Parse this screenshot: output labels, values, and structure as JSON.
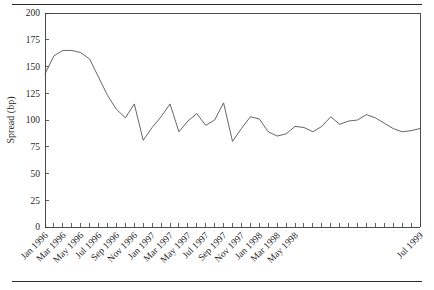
{
  "chart_data": {
    "type": "line",
    "title": "",
    "xlabel": "",
    "ylabel": "Spread (bp)",
    "ylim": [
      0,
      200
    ],
    "yticks": [
      0,
      25,
      50,
      75,
      100,
      125,
      150,
      175,
      200
    ],
    "grid": false,
    "legend": null,
    "xtick_labels": [
      "Jan 1996",
      "Mar 1996",
      "May 1996",
      "Jul 1996",
      "Sep 1996",
      "Nov 1996",
      "Jan 1997",
      "Mar 1997",
      "May 1997",
      "Jul 1997",
      "Sep 1997",
      "Nov 1997",
      "Jan 1998",
      "Mar 1998",
      "May 1998",
      "Jul 1999"
    ],
    "x": [
      "Jan 1996",
      "Feb 1996",
      "Mar 1996",
      "Apr 1996",
      "May 1996",
      "Jun 1996",
      "Jul 1996",
      "Aug 1996",
      "Sep 1996",
      "Oct 1996",
      "Nov 1996",
      "Dec 1996",
      "Jan 1997",
      "Feb 1997",
      "Mar 1997",
      "Apr 1997",
      "May 1997",
      "Jun 1997",
      "Jul 1997",
      "Aug 1997",
      "Sep 1997",
      "Oct 1997",
      "Nov 1997",
      "Dec 1997",
      "Jan 1998",
      "Feb 1998",
      "Mar 1998",
      "Apr 1998",
      "May 1998",
      "Jun 1998",
      "Jul 1998",
      "Aug 1998",
      "Sep 1998",
      "Oct 1998",
      "Nov 1998",
      "Dec 1998",
      "Jan 1999",
      "Feb 1999",
      "Mar 1999",
      "Apr 1999",
      "May 1999",
      "Jun 1999",
      "Jul 1999"
    ],
    "values": [
      143,
      160,
      165,
      165,
      163,
      157,
      140,
      123,
      110,
      102,
      115,
      81,
      93,
      103,
      115,
      89,
      99,
      106,
      95,
      100,
      116,
      80,
      92,
      103,
      101,
      89,
      85,
      87,
      94,
      93,
      89,
      94,
      103,
      96,
      99,
      100,
      105,
      102,
      97,
      92,
      89,
      90,
      92
    ],
    "units": "bp",
    "series_name": "Spread"
  },
  "axes": {
    "y_axis_title": "Spread (bp)"
  }
}
